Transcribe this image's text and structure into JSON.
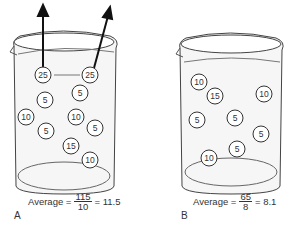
{
  "beakers": [
    {
      "id": "A",
      "label": "A",
      "caption": {
        "prefix": "Average =",
        "numerator": "115",
        "denominator": "10",
        "result": "= 11.5"
      },
      "molecules": [
        {
          "value": "25",
          "x": 43,
          "y": 75,
          "escaping": true
        },
        {
          "value": "25",
          "x": 90,
          "y": 75,
          "escaping": true
        },
        {
          "value": "5",
          "x": 45,
          "y": 100
        },
        {
          "value": "5",
          "x": 80,
          "y": 93
        },
        {
          "value": "10",
          "x": 26,
          "y": 117
        },
        {
          "value": "10",
          "x": 76,
          "y": 117
        },
        {
          "value": "5",
          "x": 46,
          "y": 131
        },
        {
          "value": "5",
          "x": 95,
          "y": 128
        },
        {
          "value": "15",
          "x": 71,
          "y": 146
        },
        {
          "value": "10",
          "x": 90,
          "y": 160
        }
      ]
    },
    {
      "id": "B",
      "label": "B",
      "caption": {
        "prefix": "Average =",
        "numerator": "65",
        "denominator": "8",
        "result": "= 8.1"
      },
      "molecules": [
        {
          "value": "10",
          "x": 199,
          "y": 82
        },
        {
          "value": "15",
          "x": 215,
          "y": 96
        },
        {
          "value": "10",
          "x": 264,
          "y": 94
        },
        {
          "value": "5",
          "x": 197,
          "y": 120
        },
        {
          "value": "5",
          "x": 235,
          "y": 118
        },
        {
          "value": "5",
          "x": 261,
          "y": 134
        },
        {
          "value": "5",
          "x": 237,
          "y": 149
        },
        {
          "value": "10",
          "x": 209,
          "y": 158
        }
      ]
    }
  ]
}
